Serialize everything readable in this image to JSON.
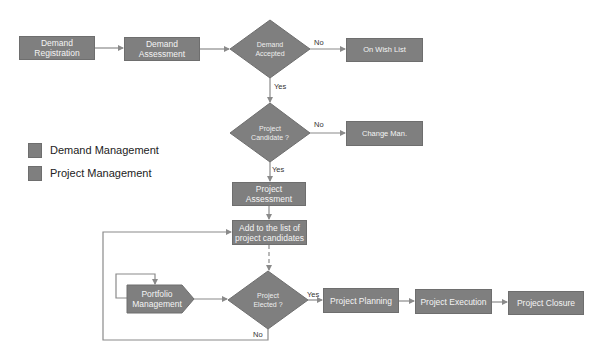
{
  "colors": {
    "shape_fill": "#7f7f7f",
    "shape_border": "#6e6e6e",
    "shape_text": "#f4f4f4",
    "connector": "#8a8a8a"
  },
  "nodes": {
    "demand_registration": "Demand Registration",
    "demand_assessment": "Demand Assessment",
    "demand_accepted": "Demand Accepted",
    "on_wish_list": "On Wish List",
    "project_candidate": "Project Candidate ?",
    "change_man": "Change Man.",
    "project_assessment": "Project Assessment",
    "add_to_list": "Add to the list of project candidates",
    "portfolio_management": "Portfolio Management",
    "project_elected": "Project Elected ?",
    "project_planning": "Project Planning",
    "project_execution": "Project Execution",
    "project_closure": "Project Closure"
  },
  "edge_labels": {
    "accepted_no": "No",
    "accepted_yes": "Yes",
    "candidate_no": "No",
    "candidate_yes": "Yes",
    "elected_yes": "Yes",
    "elected_no": "No"
  },
  "legend": [
    {
      "label": "Demand Management"
    },
    {
      "label": "Project Management"
    }
  ]
}
